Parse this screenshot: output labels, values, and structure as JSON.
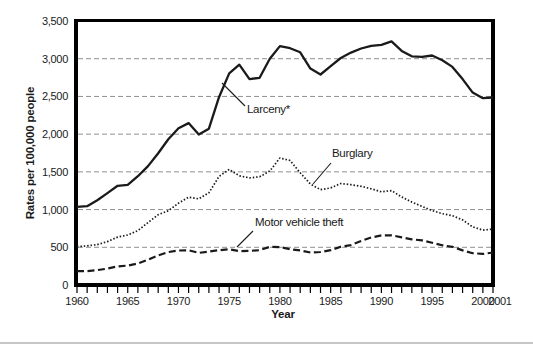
{
  "chart_data": {
    "type": "line",
    "title": "",
    "xlabel": "Year",
    "ylabel": "Rates per 100,000 people",
    "x_range": [
      1960,
      2001
    ],
    "ylim": [
      0,
      3500
    ],
    "grid": "horizontal-dashed-gray",
    "legend_position": "inline-annotations",
    "y_ticks": [
      0,
      500,
      1000,
      1500,
      2000,
      2500,
      3000,
      3500
    ],
    "y_tick_labels": [
      "0",
      "500",
      "1,000",
      "1,500",
      "2,000",
      "2,500",
      "3,000",
      "3,500"
    ],
    "x_tick_years": [
      1960,
      1965,
      1970,
      1975,
      1980,
      1985,
      1990,
      1995,
      2000,
      2001
    ],
    "years": [
      1960,
      1961,
      1962,
      1963,
      1964,
      1965,
      1966,
      1967,
      1968,
      1969,
      1970,
      1971,
      1972,
      1973,
      1974,
      1975,
      1976,
      1977,
      1978,
      1979,
      1980,
      1981,
      1982,
      1983,
      1984,
      1985,
      1986,
      1987,
      1988,
      1989,
      1990,
      1991,
      1992,
      1993,
      1994,
      1995,
      1996,
      1997,
      1998,
      1999,
      2000,
      2001
    ],
    "series": [
      {
        "name": "Larceny",
        "annotation": "Larceny*",
        "line_style": "solid",
        "values": [
          1035,
          1045,
          1124,
          1219,
          1315,
          1329,
          1443,
          1576,
          1747,
          1931,
          2079,
          2146,
          1994,
          2072,
          2490,
          2805,
          2921,
          2730,
          2747,
          2999,
          3167,
          3140,
          3085,
          2869,
          2791,
          2901,
          3010,
          3081,
          3135,
          3171,
          3185,
          3229,
          3103,
          3032,
          3026,
          3043,
          2980,
          2892,
          2730,
          2551,
          2477,
          2486
        ]
      },
      {
        "name": "Burglary",
        "annotation": "Burglary",
        "line_style": "dotted",
        "values": [
          509,
          519,
          535,
          576,
          635,
          663,
          721,
          827,
          932,
          984,
          1085,
          1164,
          1141,
          1223,
          1438,
          1532,
          1448,
          1420,
          1435,
          1512,
          1684,
          1650,
          1488,
          1338,
          1264,
          1287,
          1345,
          1330,
          1309,
          1276,
          1236,
          1252,
          1168,
          1099,
          1042,
          987,
          945,
          919,
          863,
          770,
          728,
          741
        ]
      },
      {
        "name": "Motor vehicle theft",
        "annotation": "Motor vehicle theft",
        "line_style": "dashed",
        "values": [
          183,
          183,
          197,
          217,
          247,
          257,
          287,
          334,
          393,
          436,
          457,
          460,
          426,
          443,
          462,
          473,
          450,
          452,
          461,
          506,
          502,
          475,
          459,
          431,
          437,
          462,
          508,
          529,
          583,
          630,
          658,
          659,
          632,
          606,
          591,
          560,
          526,
          506,
          459,
          422,
          412,
          431
        ]
      }
    ],
    "colors": {
      "line": "#1a1a1a",
      "axis": "#000000",
      "grid": "#8f8f8f",
      "page_rule": "#c6c6c6",
      "background": "#ffffff"
    }
  }
}
